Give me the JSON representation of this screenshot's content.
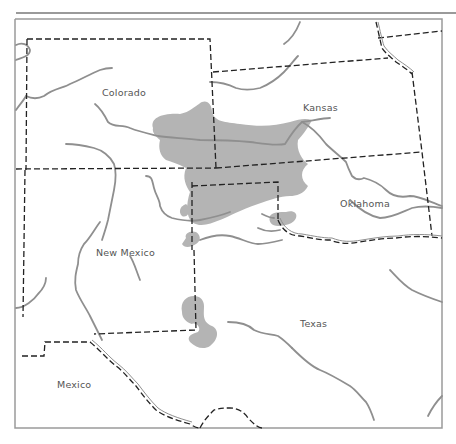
{
  "map": {
    "type": "regional-map",
    "colors": {
      "frame": "#9a9a9a",
      "rivers": "#8f8f8f",
      "boundaries": "#222222",
      "shaded_region": "#b4b4b4",
      "background": "#ffffff",
      "label_text": "#555555"
    },
    "labels": [
      {
        "id": "colorado",
        "text": "Colorado"
      },
      {
        "id": "kansas",
        "text": "Kansas"
      },
      {
        "id": "oklahoma",
        "text": "Oklahoma"
      },
      {
        "id": "new_mexico",
        "text": "New Mexico"
      },
      {
        "id": "texas",
        "text": "Texas"
      },
      {
        "id": "mexico",
        "text": "Mexico"
      }
    ],
    "legend": {
      "dashed_line": "state / national boundary",
      "gray_line": "river",
      "gray_fill": "shaded region"
    }
  }
}
